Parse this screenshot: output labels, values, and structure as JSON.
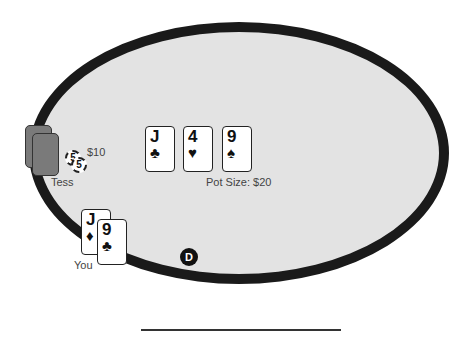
{
  "table": {
    "felt_color": "#e3e3e3",
    "rail_color": "#1a1a1a"
  },
  "opponent": {
    "name": "Tess",
    "bet": "$10",
    "chips": [
      {
        "value": "5"
      },
      {
        "value": "5"
      }
    ],
    "cards_face_down": 2
  },
  "board": {
    "cards": [
      {
        "rank": "J",
        "suit": "♣"
      },
      {
        "rank": "4",
        "suit": "♥"
      },
      {
        "rank": "9",
        "suit": "♠"
      }
    ],
    "pot_label": "Pot Size: $20"
  },
  "hero": {
    "name": "You",
    "cards": [
      {
        "rank": "J",
        "suit": "♦"
      },
      {
        "rank": "9",
        "suit": "♣"
      }
    ]
  },
  "dealer_button": {
    "label": "D"
  }
}
